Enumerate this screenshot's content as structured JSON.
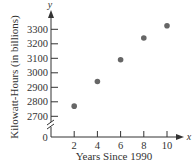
{
  "chart_data": {
    "type": "scatter",
    "title": "",
    "xlabel": "Years Since 1990",
    "ylabel": "Kilowatt-Hours (in billions)",
    "x_axis_var": "x",
    "y_axis_var": "y",
    "x": [
      2,
      4,
      6,
      8,
      10
    ],
    "y": [
      2770,
      2940,
      3090,
      3240,
      3325
    ],
    "x_ticks": [
      2,
      4,
      6,
      8,
      10
    ],
    "y_ticks": [
      2700,
      2800,
      2900,
      3000,
      3100,
      3200,
      3300
    ],
    "origin_label": "0",
    "xlim": [
      0,
      11
    ],
    "ylim": [
      2700,
      3380
    ],
    "y_axis_break": true,
    "grid": false,
    "legend": null,
    "marker_color": "#666666",
    "axis_color": "#333333"
  }
}
